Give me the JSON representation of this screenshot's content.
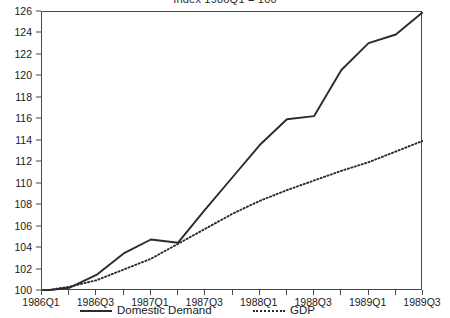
{
  "chart_data": {
    "type": "line",
    "title": "Index 1986Q1 = 100",
    "xlabel": "",
    "ylabel": "",
    "ylim": [
      100,
      126
    ],
    "xlim": [
      "1986Q1",
      "1989Q3"
    ],
    "ytick_step": 2,
    "grid": false,
    "legend_position": "bottom",
    "ytick_labels": [
      "126",
      "124",
      "122",
      "120",
      "118",
      "116",
      "114",
      "112",
      "110",
      "108",
      "106",
      "104",
      "102",
      "100"
    ],
    "ytick_values": [
      126,
      124,
      122,
      120,
      118,
      116,
      114,
      112,
      110,
      108,
      106,
      104,
      102,
      100
    ],
    "x": [
      "1986Q1",
      "1986Q2",
      "1986Q3",
      "1986Q4",
      "1987Q1",
      "1987Q2",
      "1987Q3",
      "1987Q4",
      "1988Q1",
      "1988Q2",
      "1988Q3",
      "1988Q4",
      "1989Q1",
      "1989Q2",
      "1989Q3"
    ],
    "xtick_labels": [
      "1986Q1",
      "1986Q3",
      "1987Q1",
      "1987Q3",
      "1988Q1",
      "1988Q3",
      "1989Q1",
      "1989Q3"
    ],
    "xtick_indices": [
      0,
      2,
      4,
      6,
      8,
      10,
      12,
      14
    ],
    "series": [
      {
        "name": "Domestic Demand",
        "style": "solid",
        "color": "#2b2b2b",
        "values": [
          100.0,
          100.3,
          101.5,
          103.5,
          104.8,
          104.5,
          107.6,
          110.6,
          113.6,
          116.0,
          116.3,
          120.6,
          123.1,
          123.9,
          126.0
        ]
      },
      {
        "name": "GDP",
        "style": "dotted",
        "color": "#2b2b2b",
        "values": [
          100.0,
          100.4,
          101.0,
          102.0,
          103.0,
          104.4,
          105.8,
          107.2,
          108.4,
          109.4,
          110.3,
          111.2,
          112.0,
          113.0,
          114.0
        ]
      }
    ]
  },
  "legend": {
    "items": [
      {
        "label": "Domestic Demand"
      },
      {
        "label": "GDP"
      }
    ]
  }
}
